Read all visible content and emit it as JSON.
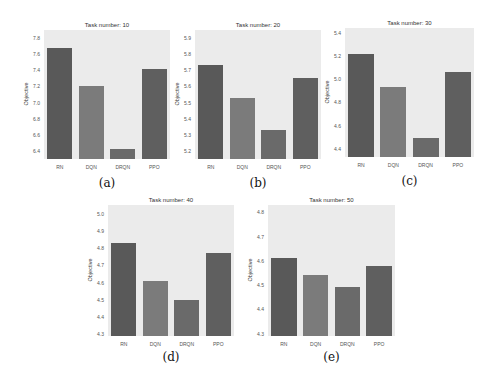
{
  "colors": {
    "background": "#ebebeb",
    "RN": "#595959",
    "DQN": "#7b7b7b",
    "DRQN": "#6a6a6a",
    "PPO": "#5f5f5f"
  },
  "chart_data": [
    {
      "type": "bar",
      "caption": "(a)",
      "title": "Task number: 10",
      "xlabel": "",
      "ylabel": "Objective",
      "categories": [
        "RN",
        "DQN",
        "DRQN",
        "PPO"
      ],
      "values": [
        7.68,
        7.21,
        6.42,
        7.42
      ],
      "yticks": [
        "6.4",
        "6.6",
        "6.8",
        "7.0",
        "7.2",
        "7.4",
        "7.6",
        "7.8"
      ],
      "ylim": [
        6.3,
        7.9
      ],
      "grid": false
    },
    {
      "type": "bar",
      "caption": "(b)",
      "title": "Task number: 20",
      "xlabel": "",
      "ylabel": "Objective",
      "categories": [
        "RN",
        "DQN",
        "DRQN",
        "PPO"
      ],
      "values": [
        5.73,
        5.53,
        5.33,
        5.65
      ],
      "yticks": [
        "5.2",
        "5.3",
        "5.4",
        "5.5",
        "5.6",
        "5.7",
        "5.8",
        "5.9"
      ],
      "ylim": [
        5.15,
        5.95
      ],
      "grid": false
    },
    {
      "type": "bar",
      "caption": "(c)",
      "title": "Task number: 30",
      "xlabel": "",
      "ylabel": "Objective",
      "categories": [
        "RN",
        "DQN",
        "DRQN",
        "PPO"
      ],
      "values": [
        5.22,
        4.93,
        4.49,
        5.06
      ],
      "yticks": [
        "4.4",
        "4.6",
        "4.8",
        "5.0",
        "5.2",
        "5.4"
      ],
      "ylim": [
        4.33,
        5.44
      ],
      "grid": false
    },
    {
      "type": "bar",
      "caption": "(d)",
      "title": "Task number: 40",
      "xlabel": "",
      "ylabel": "Objective",
      "categories": [
        "RN",
        "DQN",
        "DRQN",
        "PPO"
      ],
      "values": [
        4.83,
        4.61,
        4.5,
        4.77
      ],
      "yticks": [
        "4.3",
        "4.4",
        "4.5",
        "4.6",
        "4.7",
        "4.8",
        "4.9",
        "5.0"
      ],
      "ylim": [
        4.29,
        5.05
      ],
      "grid": false
    },
    {
      "type": "bar",
      "caption": "(e)",
      "title": "Task number: 50",
      "xlabel": "",
      "ylabel": "Objective",
      "categories": [
        "RN",
        "DQN",
        "DRQN",
        "PPO"
      ],
      "values": [
        4.61,
        4.54,
        4.49,
        4.58
      ],
      "yticks": [
        "4.3",
        "4.4",
        "4.5",
        "4.6",
        "4.7",
        "4.8"
      ],
      "ylim": [
        4.29,
        4.83
      ],
      "grid": false
    }
  ],
  "layout": [
    {
      "left": 44,
      "top": 30,
      "width": 126,
      "height": 129,
      "captionY": 176
    },
    {
      "left": 195,
      "top": 30,
      "width": 126,
      "height": 129,
      "captionY": 176
    },
    {
      "left": 345,
      "top": 28,
      "width": 129,
      "height": 129,
      "captionY": 174
    },
    {
      "left": 108,
      "top": 205,
      "width": 126,
      "height": 131,
      "captionY": 350
    },
    {
      "left": 268,
      "top": 205,
      "width": 127,
      "height": 131,
      "captionY": 350
    }
  ]
}
